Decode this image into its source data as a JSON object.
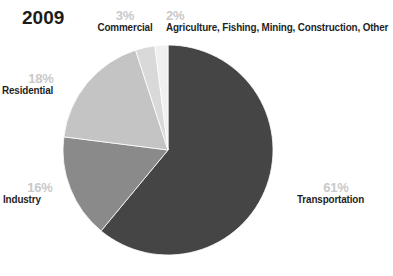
{
  "title": "2009",
  "chart_data": {
    "type": "pie",
    "title": "2009",
    "subtitle": "",
    "xlabel": "",
    "ylabel": "",
    "legend_position": "none",
    "grid": false,
    "start_angle_deg": 0,
    "direction": "clockwise",
    "categories": [
      "Transportation",
      "Industry",
      "Residential",
      "Commercial",
      "Agriculture, Fishing, Mining, Construction, Other"
    ],
    "values": [
      61,
      16,
      18,
      3,
      2
    ],
    "value_labels": [
      "61%",
      "16%",
      "18%",
      "3%",
      "2%"
    ],
    "unit": "%",
    "slices": [
      {
        "name": "Transportation",
        "value": 61,
        "label": "61%",
        "color": "#454545",
        "label_position": "right"
      },
      {
        "name": "Industry",
        "value": 16,
        "label": "16%",
        "color": "#8a8a8a",
        "label_position": "lower-left"
      },
      {
        "name": "Residential",
        "value": 18,
        "label": "18%",
        "color": "#c4c4c4",
        "label_position": "left"
      },
      {
        "name": "Commercial",
        "value": 3,
        "label": "3%",
        "color": "#d9d9d9",
        "label_position": "top"
      },
      {
        "name": "Agriculture, Fishing, Mining, Construction, Other",
        "value": 2,
        "label": "2%",
        "color": "#f0f0f0",
        "label_position": "top-right"
      }
    ]
  },
  "labels": {
    "transportation": {
      "pct": "61%",
      "name": "Transportation"
    },
    "industry": {
      "pct": "16%",
      "name": "Industry"
    },
    "residential": {
      "pct": "18%",
      "name": "Residential"
    },
    "commercial": {
      "pct": "3%",
      "name": "Commercial"
    },
    "agriculture": {
      "pct": "2%",
      "name": "Agriculture, Fishing, Mining, Construction, Other"
    }
  },
  "colors": {
    "background": "#ffffff",
    "text_dark": "#1f1f1f",
    "text_pct": "#c9c9c9",
    "transportation": "#454545",
    "industry": "#8a8a8a",
    "residential": "#c4c4c4",
    "commercial": "#d9d9d9",
    "agriculture": "#f0f0f0"
  }
}
